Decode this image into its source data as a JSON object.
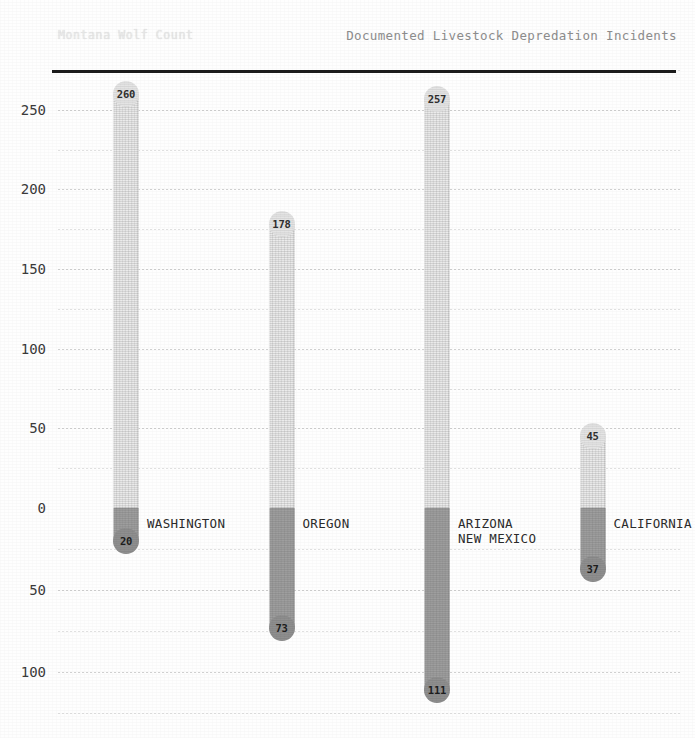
{
  "titles": {
    "left": "Montana Wolf Count",
    "right": "Documented Livestock Depredation Incidents"
  },
  "colors": {
    "positive_bar": "#ebebeb",
    "negative_bar": "#9e9e9e",
    "zero_line": "#1c1c1c",
    "gridline": "#c8c8c8",
    "text": "#2b2b2b"
  },
  "chart_data": {
    "type": "bar",
    "title": "Documented Livestock Depredation Incidents",
    "subtitle": "Montana Wolf Count",
    "xlabel": "",
    "ylabel": "",
    "grid": true,
    "legend": "none",
    "orientation": "vertical-diverging",
    "categories": [
      "WASHINGTON",
      "OREGON",
      "ARIZONA\nNEW MEXICO",
      "CALIFORNIA"
    ],
    "series": [
      {
        "name": "Above axis",
        "values": [
          260,
          178,
          257,
          45
        ]
      },
      {
        "name": "Below axis",
        "values": [
          20,
          73,
          111,
          37
        ]
      }
    ],
    "upper_axis": {
      "ticks": [
        0,
        50,
        100,
        150,
        200,
        250
      ],
      "tick_labels": [
        "0",
        "50",
        "100",
        "150",
        "200",
        "250"
      ],
      "minor_ticks": [
        25,
        75,
        125,
        175,
        225,
        275
      ],
      "range": [
        0,
        275
      ]
    },
    "lower_axis": {
      "ticks": [
        0,
        50,
        100
      ],
      "tick_labels": [
        "0",
        "50",
        "100"
      ],
      "minor_ticks": [
        25,
        75,
        125
      ],
      "range": [
        0,
        128
      ]
    }
  },
  "bars": [
    {
      "category": "WASHINGTON",
      "label_line1": "WASHINGTON",
      "label_line2": "",
      "pos": 260,
      "neg": 20,
      "pos_text": "260",
      "neg_text": "20"
    },
    {
      "category": "OREGON",
      "label_line1": "OREGON",
      "label_line2": "",
      "pos": 178,
      "neg": 73,
      "pos_text": "178",
      "neg_text": "73"
    },
    {
      "category": "ARIZONA NEW MEXICO",
      "label_line1": "ARIZONA",
      "label_line2": "NEW MEXICO",
      "pos": 257,
      "neg": 111,
      "pos_text": "257",
      "neg_text": "111"
    },
    {
      "category": "CALIFORNIA",
      "label_line1": "CALIFORNIA",
      "label_line2": "",
      "pos": 45,
      "neg": 37,
      "pos_text": "45",
      "neg_text": "37"
    }
  ],
  "yaxis": {
    "upper_labels": [
      "250",
      "200",
      "150",
      "100",
      "50",
      "0"
    ],
    "lower_labels": [
      "50",
      "100"
    ]
  }
}
